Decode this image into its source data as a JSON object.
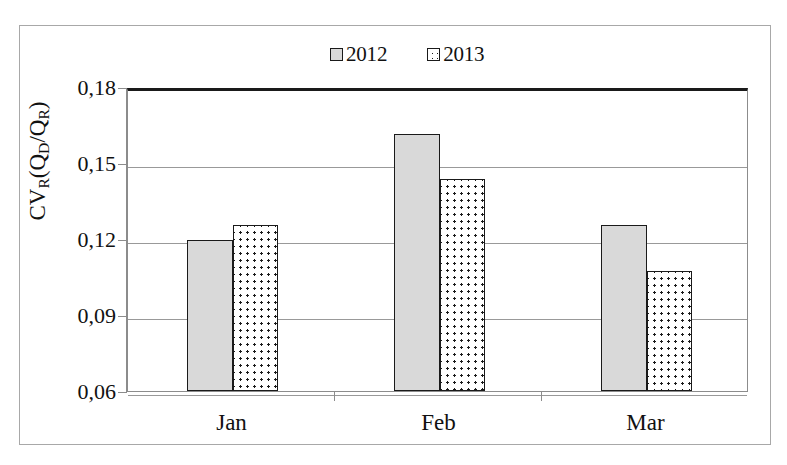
{
  "chart_data": {
    "type": "bar",
    "title": "",
    "subtitle": "",
    "xlabel": "",
    "ylabel": "CV_R(Q_D/Q_R)",
    "ylabel_parts": {
      "prefix": "CV",
      "sub1": "R",
      "open": "(Q",
      "sub2": "D",
      "slash": "/Q",
      "sub3": "R",
      "close": ")"
    },
    "categories": [
      "Jan",
      "Feb",
      "Mar"
    ],
    "series": [
      {
        "name": "2012",
        "values": [
          0.1195,
          0.1615,
          0.1255
        ],
        "fill": "solid-gray",
        "color": "#d9d9d9"
      },
      {
        "name": "2013",
        "values": [
          0.1255,
          0.1435,
          0.1075
        ],
        "fill": "dotted",
        "color": "#ffffff"
      }
    ],
    "ylim": [
      0.06,
      0.18
    ],
    "yticks": [
      0.06,
      0.09,
      0.12,
      0.15,
      0.18
    ],
    "ytick_labels": [
      "0,06",
      "0,09",
      "0,12",
      "0,15",
      "0,18"
    ],
    "grid": true,
    "grid_axis": "y",
    "legend": {
      "position": "top-center",
      "entries": [
        "2012",
        "2013"
      ]
    },
    "decimal_separator": ",",
    "frame": true
  }
}
